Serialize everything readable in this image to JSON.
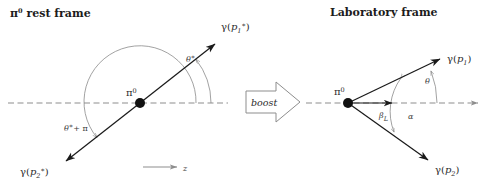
{
  "figure": {
    "width": 495,
    "height": 187,
    "background": "#ffffff",
    "ink_color": "#1a1a1a",
    "guide_color": "#8d8d8d"
  },
  "rest_frame": {
    "title": "π⁰ rest frame",
    "title_pion": "π",
    "title_pion_sup": "0",
    "title_rest": "rest frame",
    "vertex_label_symbol": "π",
    "vertex_label_sup": "0",
    "photon1_label": "γ(p₁*)",
    "photon1_gamma": "γ(",
    "photon1_p": "p",
    "photon1_sub": "1",
    "photon1_star": "∗",
    "photon1_close": ")",
    "photon2_label": "γ(p₂*)",
    "photon2_gamma": "γ(",
    "photon2_p": "p",
    "photon2_sub": "2",
    "photon2_star": "∗",
    "photon2_close": ")",
    "angle_theta_star": "θ",
    "angle_theta_star_sup": "∗",
    "angle_theta_star_plus_pi_theta": "θ",
    "angle_theta_star_plus_pi_sup": "∗",
    "angle_theta_star_plus_pi_rest": "+ π",
    "z_axis_label": "z",
    "photon_ray_angle_deg": 38
  },
  "boost": {
    "label": "boost",
    "direction": "right"
  },
  "lab_frame": {
    "title": "Laboratory frame",
    "vertex_label_symbol": "π",
    "vertex_label_sup": "0",
    "photon1_gamma": "γ(",
    "photon1_p": "p",
    "photon1_sub": "1",
    "photon1_close": ")",
    "photon2_gamma": "γ(",
    "photon2_p": "p",
    "photon2_sub": "2",
    "photon2_close": ")",
    "angle_theta": "θ",
    "angle_alpha": "α",
    "beta_symbol": "β",
    "beta_sub": "L",
    "photon1_angle_deg": 20,
    "photon2_angle_deg": 35
  }
}
